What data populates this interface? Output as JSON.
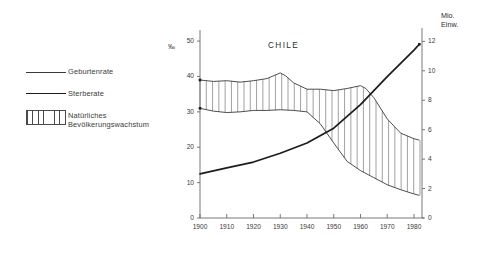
{
  "chart_data": {
    "type": "line",
    "title": "CHILE",
    "xlabel": "",
    "ylabel": "‰",
    "y2label": "Mio. Einw.",
    "xlim": [
      1900,
      1983
    ],
    "ylim": [
      0,
      52
    ],
    "y2lim": [
      0,
      12.5
    ],
    "grid": false,
    "legend_position": "left-outside",
    "x_ticks": [
      "1900",
      "1910",
      "1920",
      "1930",
      "1940",
      "1950",
      "1960",
      "1970",
      "1980"
    ],
    "y_ticks_left": [
      "0",
      "10",
      "20",
      "30",
      "40",
      "50"
    ],
    "y_ticks_right": [
      "0",
      "2",
      "4",
      "6",
      "8",
      "10",
      "12"
    ],
    "series": [
      {
        "name": "Geburtenrate",
        "axis": "left",
        "style": "thin-line",
        "x": [
          1900,
          1905,
          1910,
          1915,
          1920,
          1925,
          1930,
          1932,
          1935,
          1940,
          1945,
          1950,
          1955,
          1960,
          1962,
          1965,
          1970,
          1975,
          1980,
          1982
        ],
        "values": [
          39.0,
          38.6,
          38.8,
          38.4,
          38.8,
          39.4,
          41.0,
          40.2,
          38.2,
          36.4,
          36.4,
          36.0,
          36.6,
          37.4,
          36.6,
          34.0,
          28.0,
          24.0,
          22.4,
          22.0
        ]
      },
      {
        "name": "Sterberate",
        "axis": "left",
        "style": "thin-line-lower",
        "x": [
          1900,
          1905,
          1910,
          1915,
          1920,
          1925,
          1930,
          1935,
          1940,
          1945,
          1950,
          1955,
          1960,
          1965,
          1970,
          1975,
          1980,
          1982
        ],
        "values": [
          31.0,
          30.2,
          29.8,
          30.0,
          30.4,
          30.4,
          30.6,
          30.4,
          30.0,
          26.6,
          21.2,
          16.0,
          13.4,
          11.4,
          9.4,
          8.0,
          6.8,
          6.4
        ]
      },
      {
        "name": "Bevoelkerung",
        "axis": "right",
        "style": "thick-line",
        "x": [
          1900,
          1910,
          1920,
          1930,
          1940,
          1950,
          1960,
          1970,
          1980,
          1982
        ],
        "values": [
          3.0,
          3.4,
          3.8,
          4.4,
          5.1,
          6.1,
          7.7,
          9.6,
          11.4,
          11.8
        ]
      }
    ],
    "band": {
      "name": "Natürliches Bevölkerungswachstum",
      "between": [
        "Geburtenrate",
        "Sterberate"
      ],
      "fill": "vertical-hatch"
    }
  },
  "legend": {
    "items": [
      {
        "label": "Geburtenrate",
        "key": "thin-line-key"
      },
      {
        "label": "Sterberate",
        "key": "thick-line-key"
      },
      {
        "label": "Natürliches",
        "label2": "Bevölkerungswachstum",
        "key": "hatch-box-key"
      }
    ]
  },
  "colors": {
    "line": "#3a3a3a",
    "thick_line": "#1c1c1c",
    "axis": "#6a6a6a",
    "text": "#3a3a3a",
    "background": "#ffffff"
  }
}
